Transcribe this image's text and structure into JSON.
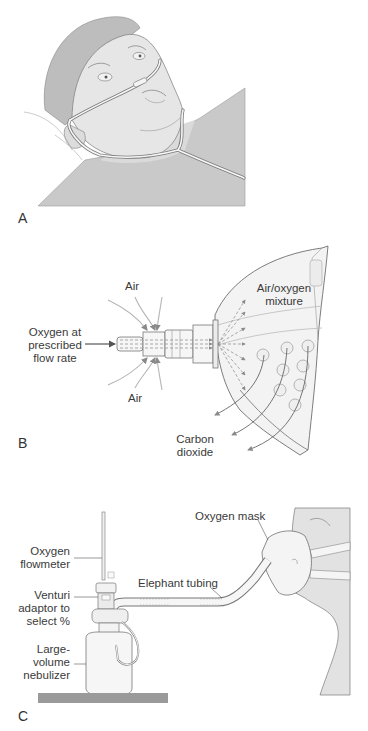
{
  "figure": {
    "panels": [
      {
        "id": "A",
        "letter": "A",
        "description": "Patient lying down wearing a nasal cannula"
      },
      {
        "id": "B",
        "letter": "B",
        "description": "Venturi mask airflow diagram",
        "labels": {
          "oxygen_line1": "Oxygen at",
          "oxygen_line2": "prescribed",
          "oxygen_line3": "flow rate",
          "air_top": "Air",
          "air_bottom": "Air",
          "mixture_line1": "Air/oxygen",
          "mixture_line2": "mixture",
          "co2_line1": "Carbon",
          "co2_line2": "dioxide"
        }
      },
      {
        "id": "C",
        "letter": "C",
        "description": "Large-volume nebulizer setup with oxygen mask",
        "labels": {
          "flowmeter_line1": "Oxygen",
          "flowmeter_line2": "flowmeter",
          "venturi_line1": "Venturi",
          "venturi_line2": "adaptor to",
          "venturi_line3": "select %",
          "nebulizer_line1": "Large-",
          "nebulizer_line2": "volume",
          "nebulizer_line3": "nebulizer",
          "tubing": "Elephant tubing",
          "mask": "Oxygen mask"
        }
      }
    ]
  },
  "colors": {
    "skin": "#e6e6e6",
    "hair": "#bdbdbd",
    "shirt": "#c8c8c8",
    "outline": "#6e6e6e",
    "arrow": "#8a8a8a",
    "table": "#9a9a9a"
  }
}
